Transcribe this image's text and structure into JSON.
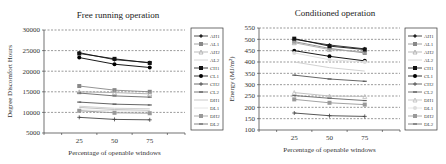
{
  "chart_data": [
    {
      "type": "line",
      "title": "Free running operation",
      "xlabel": "Percentage of openable windows",
      "ylabel": "Degree Discomfort Hours",
      "x": [
        25,
        50,
        75
      ],
      "ylim": [
        5000,
        30000
      ],
      "yticks": [
        5000,
        10000,
        15000,
        20000,
        25000,
        30000
      ],
      "grid": "horizontal-dashed",
      "legend": "right",
      "series": [
        {
          "name": "AH1",
          "values": [
            24500,
            22800,
            22100
          ],
          "color": "#222222",
          "marker": "diamond"
        },
        {
          "name": "AL1",
          "values": [
            16400,
            15400,
            15000
          ],
          "color": "#888888",
          "marker": "square"
        },
        {
          "name": "AH2",
          "values": [
            15000,
            14800,
            14500
          ],
          "color": "#aaaaaa",
          "marker": "triangle"
        },
        {
          "name": "AL2",
          "values": [
            11500,
            11000,
            10900
          ],
          "color": "#cccccc",
          "marker": "none"
        },
        {
          "name": "CH1",
          "values": [
            24300,
            23000,
            22000
          ],
          "color": "#111111",
          "marker": "square"
        },
        {
          "name": "CL1",
          "values": [
            23300,
            21700,
            20900
          ],
          "color": "#000000",
          "marker": "circle"
        },
        {
          "name": "CH2",
          "values": [
            8800,
            8300,
            8200
          ],
          "color": "#444444",
          "marker": "plus"
        },
        {
          "name": "CL2",
          "values": [
            12500,
            12000,
            11800
          ],
          "color": "#555555",
          "marker": "dash"
        },
        {
          "name": "DH1",
          "values": [
            11200,
            10700,
            10500
          ],
          "color": "#bbbbbb",
          "marker": "none"
        },
        {
          "name": "DL1",
          "values": [
            10600,
            10400,
            10300
          ],
          "color": "#dddddd",
          "marker": "none"
        },
        {
          "name": "DH2",
          "values": [
            10400,
            9900,
            9800
          ],
          "color": "#999999",
          "marker": "square"
        },
        {
          "name": "DL2",
          "values": [
            14700,
            14000,
            13700
          ],
          "color": "#666666",
          "marker": "dash"
        }
      ]
    },
    {
      "type": "line",
      "title": "Conditioned operation",
      "xlabel": "Percentage of openable windows",
      "ylabel": "Energy (MJ/m²)",
      "x": [
        25,
        50,
        75
      ],
      "ylim": [
        100,
        550
      ],
      "yticks": [
        100,
        150,
        200,
        250,
        300,
        350,
        400,
        450,
        500,
        550
      ],
      "grid": "horizontal-dashed",
      "legend": "right",
      "series": [
        {
          "name": "AH1",
          "values": [
            500,
            475,
            458
          ],
          "color": "#222222",
          "marker": "diamond"
        },
        {
          "name": "AL1",
          "values": [
            490,
            460,
            440
          ],
          "color": "#888888",
          "marker": "square"
        },
        {
          "name": "AH2",
          "values": [
            485,
            455,
            445
          ],
          "color": "#aaaaaa",
          "marker": "triangle"
        },
        {
          "name": "AL2",
          "values": [
            400,
            375,
            360
          ],
          "color": "#cccccc",
          "marker": "none"
        },
        {
          "name": "CH1",
          "values": [
            503,
            470,
            455
          ],
          "color": "#111111",
          "marker": "square"
        },
        {
          "name": "CL1",
          "values": [
            450,
            425,
            405
          ],
          "color": "#000000",
          "marker": "circle"
        },
        {
          "name": "CH2",
          "values": [
            175,
            163,
            160
          ],
          "color": "#444444",
          "marker": "plus"
        },
        {
          "name": "CL2",
          "values": [
            342,
            325,
            315
          ],
          "color": "#555555",
          "marker": "dash"
        },
        {
          "name": "DH1",
          "values": [
            265,
            250,
            248
          ],
          "color": "#bbbbbb",
          "marker": "triangle"
        },
        {
          "name": "DL1",
          "values": [
            440,
            410,
            400
          ],
          "color": "#dddddd",
          "marker": "circle"
        },
        {
          "name": "DH2",
          "values": [
            235,
            220,
            212
          ],
          "color": "#999999",
          "marker": "square"
        },
        {
          "name": "DL2",
          "values": [
            252,
            240,
            230
          ],
          "color": "#666666",
          "marker": "dash"
        }
      ]
    }
  ]
}
